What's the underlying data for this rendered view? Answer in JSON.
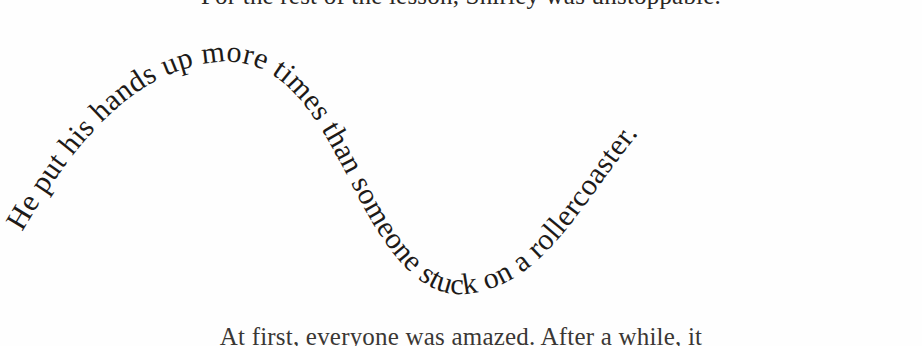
{
  "page": {
    "background_color": "#fefefe",
    "text_color": "#1d1a18"
  },
  "body_text": {
    "line_above": "For the rest of the lesson, Shirley was unstoppable.",
    "line_below": "At first, everyone was amazed. After a while, it"
  },
  "curved_text": {
    "content": "He put his hands up more times than someone stuck on a rollercoaster.",
    "shape": "sine-wave",
    "font_size_px": 30,
    "color": "#1d1a18",
    "path_description": "starts low-left, rises to a crest near x=220 y=60, falls to a trough near x=470 y=292, rises to a second crest near x=775 y=45, then descends to the right edge"
  }
}
